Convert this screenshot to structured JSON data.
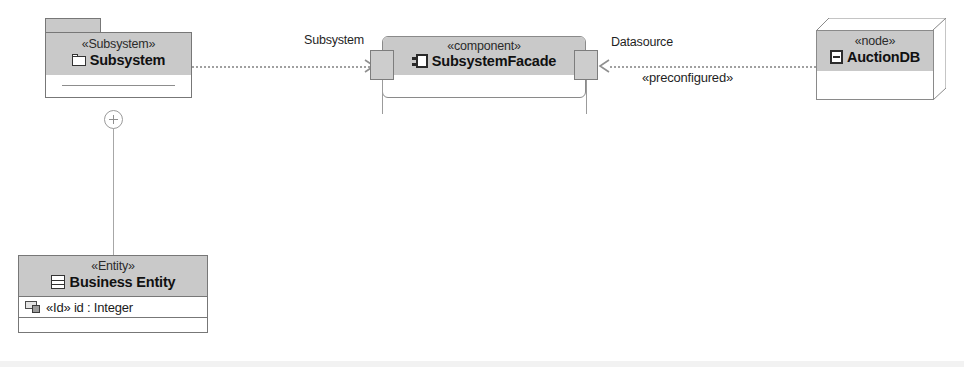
{
  "diagram": {
    "type": "UML component diagram",
    "background": "#ffffff",
    "header_fill": "#c9c9c9",
    "border_color": "#777777",
    "connector_color": "#a0a0a0"
  },
  "package_subsystem": {
    "stereotype": "«Subsystem»",
    "name": "Subsystem",
    "icon": "folder-icon"
  },
  "containment": {
    "symbol": "circle-plus"
  },
  "class_business_entity": {
    "stereotype": "«Entity»",
    "name": "Business Entity",
    "icon": "class-icon",
    "attributes": [
      {
        "icon": "key-attribute-icon",
        "text": "«Id» id : Integer"
      }
    ]
  },
  "component_facade": {
    "stereotype": "«component»",
    "name": "SubsystemFacade",
    "icon": "component-icon",
    "ports": [
      {
        "side": "left",
        "name": "subsystem-port"
      },
      {
        "side": "right",
        "name": "datasource-port"
      }
    ]
  },
  "node_auctiondb": {
    "stereotype": "«node»",
    "name": "AuctionDB",
    "icon": "node-icon"
  },
  "connectors": [
    {
      "id": "subsystem-link",
      "label": "Subsystem",
      "style": "dashed",
      "arrow": "open",
      "direction": "right"
    },
    {
      "id": "datasource-link",
      "label": "Datasource",
      "stereotype": "«preconfigured»",
      "style": "dashed",
      "arrow": "open",
      "direction": "left"
    }
  ]
}
